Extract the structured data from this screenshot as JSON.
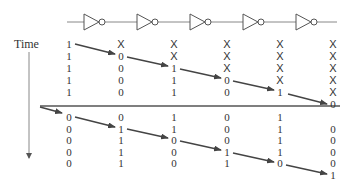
{
  "title_label": "Time",
  "inverter_count": 5,
  "colors": {
    "line": "#888888",
    "arrow": "#444444",
    "text": "#333333"
  },
  "columns_x": [
    69,
    121,
    174,
    227,
    280,
    333
  ],
  "top_rows_y": [
    44,
    56,
    68,
    80,
    92,
    104
  ],
  "bottom_rows_y": [
    117,
    129,
    140,
    152,
    163,
    175
  ],
  "top_block": [
    [
      "1",
      "1",
      "1",
      "1",
      "1",
      ""
    ],
    [
      "X",
      "0",
      "0",
      "0",
      "0",
      ""
    ],
    [
      "X",
      "X",
      "1",
      "1",
      "1",
      ""
    ],
    [
      "X",
      "X",
      "X",
      "0",
      "0",
      ""
    ],
    [
      "X",
      "X",
      "X",
      "X",
      "1",
      ""
    ],
    [
      "X",
      "X",
      "X",
      "X",
      "X",
      "0"
    ]
  ],
  "bottom_block": [
    [
      "0",
      "0",
      "0",
      "0",
      "0",
      ""
    ],
    [
      "0",
      "1",
      "1",
      "1",
      "1",
      ""
    ],
    [
      "1",
      "1",
      "0",
      "0",
      "0",
      ""
    ],
    [
      "0",
      "0",
      "0",
      "1",
      "1",
      ""
    ],
    [
      "1",
      "1",
      "1",
      "1",
      "0",
      ""
    ],
    [
      "",
      "0",
      "0",
      "0",
      "0",
      "1"
    ]
  ]
}
